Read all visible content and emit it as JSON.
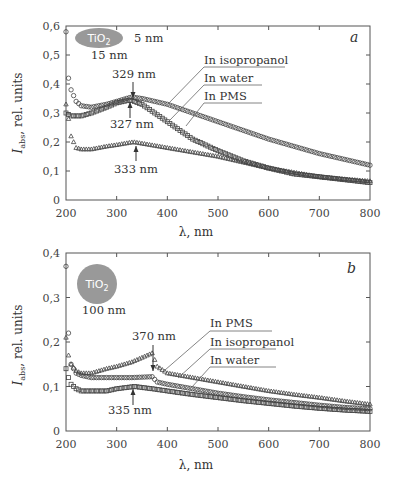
{
  "chart_data": [
    {
      "type": "scatter",
      "panel": "a",
      "title": "",
      "xlabel": "λ, nm",
      "ylabel": "I_abs, rel. units",
      "xlim": [
        200,
        800
      ],
      "ylim": [
        0,
        0.6
      ],
      "xticks": [
        "200",
        "300",
        "400",
        "500",
        "600",
        "700",
        "800"
      ],
      "yticks": [
        "0",
        "0,1",
        "0,2",
        "0,3",
        "0,4",
        "0,5",
        "0,6"
      ],
      "grid": false,
      "inset": {
        "material": "TiO2",
        "label_top": "5 nm",
        "label_bottom": "15 nm"
      },
      "annotations": [
        {
          "text": "329 nm",
          "x": 329,
          "y": 0.355,
          "direction": "down"
        },
        {
          "text": "327 nm",
          "x": 327,
          "y": 0.335,
          "direction": "up"
        },
        {
          "text": "333 nm",
          "x": 333,
          "y": 0.2,
          "direction": "up"
        }
      ],
      "series": [
        {
          "name": "In isopropanol",
          "marker": "circle",
          "x": [
            200,
            205,
            210,
            220,
            230,
            250,
            280,
            300,
            329,
            350,
            400,
            450,
            500,
            550,
            600,
            650,
            700,
            750,
            800
          ],
          "y": [
            0.58,
            0.42,
            0.38,
            0.34,
            0.325,
            0.32,
            0.33,
            0.34,
            0.355,
            0.35,
            0.33,
            0.3,
            0.27,
            0.24,
            0.21,
            0.185,
            0.16,
            0.14,
            0.12
          ]
        },
        {
          "name": "In water",
          "marker": "square",
          "x": [
            200,
            205,
            210,
            220,
            230,
            250,
            280,
            300,
            327,
            350,
            400,
            450,
            500,
            550,
            600,
            650,
            700,
            750,
            800
          ],
          "y": [
            0.3,
            0.295,
            0.29,
            0.29,
            0.29,
            0.3,
            0.32,
            0.335,
            0.345,
            0.33,
            0.27,
            0.21,
            0.17,
            0.135,
            0.11,
            0.09,
            0.08,
            0.07,
            0.06
          ]
        },
        {
          "name": "In PMS",
          "marker": "triangle",
          "x": [
            200,
            205,
            210,
            220,
            230,
            250,
            280,
            300,
            333,
            350,
            400,
            450,
            500,
            550,
            600,
            650,
            700,
            750,
            800
          ],
          "y": [
            0.33,
            0.28,
            0.22,
            0.18,
            0.175,
            0.175,
            0.185,
            0.19,
            0.2,
            0.195,
            0.18,
            0.165,
            0.15,
            0.13,
            0.11,
            0.095,
            0.08,
            0.072,
            0.065
          ]
        }
      ]
    },
    {
      "type": "scatter",
      "panel": "b",
      "title": "",
      "xlabel": "λ, nm",
      "ylabel": "I_abs, rel. units",
      "xlim": [
        200,
        800
      ],
      "ylim": [
        0,
        0.4
      ],
      "xticks": [
        "200",
        "300",
        "400",
        "500",
        "600",
        "700",
        "800"
      ],
      "yticks": [
        "0",
        "0,1",
        "0,2",
        "0,3",
        "0,4"
      ],
      "grid": false,
      "inset": {
        "material": "TiO2",
        "label_bottom": "100 nm"
      },
      "annotations": [
        {
          "text": "370 nm",
          "x": 370,
          "y": 0.175,
          "direction": "down"
        },
        {
          "text": "335 nm",
          "x": 335,
          "y": 0.1,
          "direction": "up"
        }
      ],
      "series": [
        {
          "name": "In PMS",
          "marker": "triangle",
          "x": [
            200,
            205,
            210,
            220,
            230,
            250,
            280,
            300,
            330,
            370,
            380,
            400,
            450,
            500,
            550,
            600,
            650,
            700,
            750,
            800
          ],
          "y": [
            0.21,
            0.17,
            0.15,
            0.135,
            0.13,
            0.13,
            0.14,
            0.145,
            0.155,
            0.175,
            0.145,
            0.13,
            0.12,
            0.11,
            0.1,
            0.09,
            0.082,
            0.075,
            0.067,
            0.06
          ]
        },
        {
          "name": "In isopropanol",
          "marker": "circle",
          "x": [
            200,
            205,
            210,
            220,
            230,
            250,
            280,
            300,
            330,
            370,
            380,
            400,
            450,
            500,
            550,
            600,
            650,
            700,
            750,
            800
          ],
          "y": [
            0.37,
            0.22,
            0.15,
            0.13,
            0.125,
            0.12,
            0.12,
            0.12,
            0.12,
            0.122,
            0.11,
            0.105,
            0.095,
            0.085,
            0.077,
            0.07,
            0.064,
            0.058,
            0.053,
            0.05
          ]
        },
        {
          "name": "In water",
          "marker": "square",
          "x": [
            200,
            205,
            210,
            220,
            230,
            250,
            280,
            300,
            335,
            370,
            400,
            450,
            500,
            550,
            600,
            650,
            700,
            750,
            800
          ],
          "y": [
            0.14,
            0.12,
            0.105,
            0.095,
            0.09,
            0.09,
            0.09,
            0.095,
            0.1,
            0.095,
            0.09,
            0.082,
            0.075,
            0.068,
            0.062,
            0.056,
            0.051,
            0.047,
            0.044
          ]
        }
      ]
    }
  ]
}
